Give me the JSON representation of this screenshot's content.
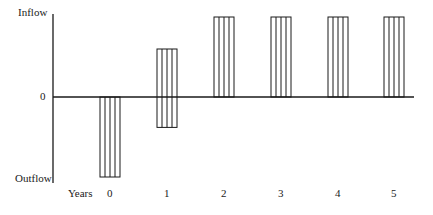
{
  "chart_data": {
    "type": "bar",
    "title": "",
    "xlabel": "Years",
    "ylabel": "",
    "y_labels": {
      "top": "Inflow",
      "zero": "0",
      "bottom": "Outflow"
    },
    "categories": [
      "0",
      "1",
      "2",
      "3",
      "4",
      "5"
    ],
    "values": [
      -1.0,
      0.6,
      1.0,
      1.0,
      1.0,
      1.0
    ],
    "bar_extents": [
      {
        "x": 0,
        "top": 0,
        "bottom": -1.0
      },
      {
        "x": 1,
        "top": 0.6,
        "bottom": -0.38
      },
      {
        "x": 2,
        "top": 1.0,
        "bottom": 0
      },
      {
        "x": 3,
        "top": 1.0,
        "bottom": 0
      },
      {
        "x": 4,
        "top": 1.0,
        "bottom": 0
      },
      {
        "x": 5,
        "top": 1.0,
        "bottom": 0
      }
    ],
    "ylim": [
      -1.0,
      1.0
    ],
    "grid": false,
    "legend": null,
    "fill": "vertical-hatch",
    "colors": {
      "line": "#1a1a1a",
      "background": "#ffffff"
    }
  }
}
